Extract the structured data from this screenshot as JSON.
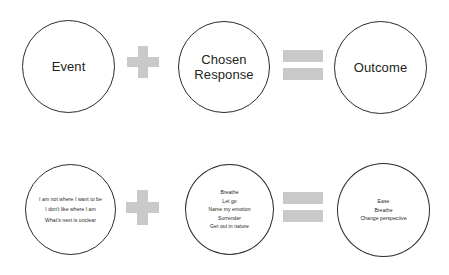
{
  "diagram": {
    "colors": {
      "circle_stroke": "#2b2b2b",
      "operator_gray": "#c9c9c9",
      "text": "#231f20",
      "background": "#ffffff"
    },
    "operators": {
      "plus": "+",
      "equals": "="
    },
    "formula_row": {
      "term_event": "Event",
      "term_response_line1": "Chosen",
      "term_response_line2": "Response",
      "term_outcome": "Outcome"
    },
    "example_row": {
      "event_items": [
        "I am not where I want to be",
        "I don't like where I am",
        "What's next is unclear"
      ],
      "response_items": [
        "Breathe",
        "Let go",
        "Name my emotion",
        "Surrender",
        "Get out in nature"
      ],
      "outcome_items": [
        "Ease",
        "Breathe",
        "Change perspective"
      ]
    }
  }
}
